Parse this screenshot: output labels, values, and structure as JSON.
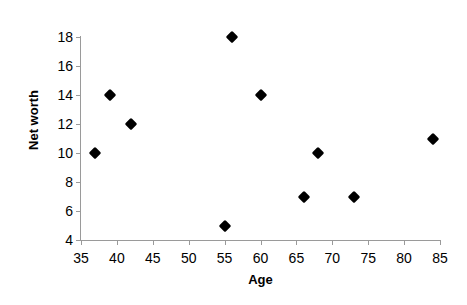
{
  "chart_data": {
    "type": "scatter",
    "title": "",
    "xlabel": "Age",
    "ylabel": "Net worth",
    "xlim": [
      35,
      85
    ],
    "ylim": [
      4,
      18
    ],
    "xticks": [
      35,
      40,
      45,
      50,
      55,
      60,
      65,
      70,
      75,
      80,
      85
    ],
    "yticks": [
      4,
      6,
      8,
      10,
      12,
      14,
      16,
      18
    ],
    "grid": false,
    "legend": null,
    "marker": "diamond",
    "marker_color": "#000000",
    "x": [
      37,
      39,
      42,
      55,
      56,
      60,
      66,
      68,
      73,
      84
    ],
    "y": [
      10,
      14,
      12,
      5,
      18,
      14,
      7,
      10,
      7,
      11
    ],
    "points": [
      {
        "x": 37,
        "y": 10
      },
      {
        "x": 39,
        "y": 14
      },
      {
        "x": 42,
        "y": 12
      },
      {
        "x": 55,
        "y": 5
      },
      {
        "x": 56,
        "y": 18
      },
      {
        "x": 60,
        "y": 14
      },
      {
        "x": 66,
        "y": 7
      },
      {
        "x": 68,
        "y": 10
      },
      {
        "x": 73,
        "y": 7
      },
      {
        "x": 84,
        "y": 11
      }
    ],
    "axis_color": "#9a9a9a",
    "background_color": "#ffffff",
    "text_color": "#000000"
  }
}
